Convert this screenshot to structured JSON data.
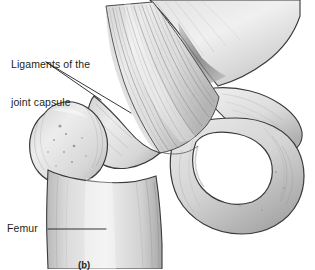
{
  "figure": {
    "caption": "(b)",
    "background_color": "#ffffff",
    "ink_color": "#231f20"
  },
  "labels": [
    {
      "id": "ligaments",
      "line1": "Ligaments of the",
      "line2": "joint capsule",
      "leader_lines": 2
    },
    {
      "id": "femur",
      "text": "Femur",
      "leader_lines": 1
    }
  ],
  "anatomy": {
    "structures": [
      "femoral-shaft",
      "greater-trochanter",
      "femoral-neck",
      "iliofemoral-ligament-fibers",
      "ilium",
      "superior-pubic-ramus",
      "obturator-foramen",
      "ischium",
      "acetabular-rim"
    ],
    "shading_color_light": "#e8e8e8",
    "shading_color_mid": "#c9c9c9",
    "shading_color_dark": "#8f8f8f",
    "outline_color": "#3a3a3a"
  }
}
